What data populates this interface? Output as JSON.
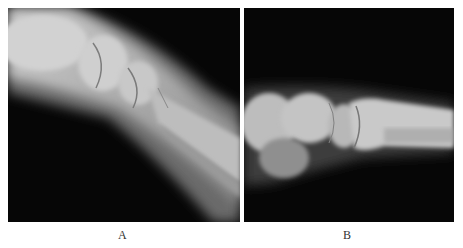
{
  "figure": {
    "panels": [
      {
        "id": "A",
        "label": "A",
        "description": "Lateral radiograph of wrist/forearm, bones diagonally descending left to right"
      },
      {
        "id": "B",
        "label": "B",
        "description": "Lateral radiograph of wrist/forearm, horizontal orientation"
      }
    ]
  }
}
